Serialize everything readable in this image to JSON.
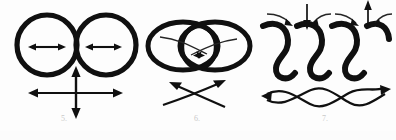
{
  "page": {
    "background_color": "#fdfdfd",
    "ink_color": "#101010",
    "caption_color": "#c9c9c9"
  },
  "figures": [
    {
      "id": "figure-5",
      "caption": "5.",
      "title": "two tangent circles with expansion arrows",
      "elements": {
        "shapes": "two thick tangent circles side by side",
        "inner_arrows": "one horizontal double-headed arrow inside each circle",
        "lower_arrows": "cross of horizontal and vertical double-headed arrows below the tangency point"
      }
    },
    {
      "id": "figure-6",
      "caption": "6.",
      "title": "two overlapping ellipses with crossing flow lines",
      "elements": {
        "shapes": "two thick overlapping ellipses forming a central lens region",
        "inner_arrows": "two thin lines crossing inside the lens with arrowheads meeting at centre",
        "lower_arrows": "two curved lines crossing in an X with arrowheads at upper-left and upper-right"
      }
    },
    {
      "id": "figure-7",
      "caption": "7.",
      "title": "S-shaped lobes with converging arrows over braided streamlines",
      "elements": {
        "shapes": "repeated thick S-shaped sinusoidal lobes",
        "upper_arrows": "curved arrows pointing inward and two straight vertical arrows, one pointing down and one pointing up",
        "lower_arrows": "two intertwined wavy braided lines with a leftward arrowhead at the left end and a rightward arrowhead at the right end"
      }
    }
  ]
}
